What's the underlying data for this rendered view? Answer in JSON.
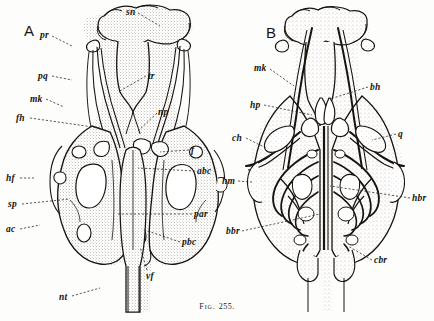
{
  "figure": {
    "caption_prefix": "Fig.",
    "caption_number": "255.",
    "panels": [
      {
        "id": "A",
        "letter": "A"
      },
      {
        "id": "B",
        "letter": "B"
      }
    ]
  },
  "colors": {
    "ink": "#17140f",
    "stipple": "#6e6456",
    "paper": "#fdfdfb",
    "leader": "#2a251e"
  },
  "labels_panel_a": [
    {
      "key": "sn",
      "text": "sn",
      "x": 126,
      "y": 8,
      "leader": [
        [
          138,
          13
        ],
        [
          160,
          26
        ]
      ]
    },
    {
      "key": "pr",
      "text": "pr",
      "x": 40,
      "y": 31,
      "leader": [
        [
          52,
          36
        ],
        [
          72,
          46
        ]
      ]
    },
    {
      "key": "pq",
      "text": "pq",
      "x": 38,
      "y": 72,
      "leader": [
        [
          52,
          76
        ],
        [
          72,
          80
        ]
      ]
    },
    {
      "key": "mk",
      "text": "mk",
      "x": 30,
      "y": 95,
      "leader": [
        [
          46,
          99
        ],
        [
          64,
          107
        ]
      ]
    },
    {
      "key": "fh",
      "text": "fh",
      "x": 16,
      "y": 114,
      "leader": [
        [
          30,
          118
        ],
        [
          100,
          128
        ]
      ]
    },
    {
      "key": "tr",
      "text": "tr",
      "x": 148,
      "y": 72,
      "leader": [
        [
          146,
          76
        ],
        [
          118,
          92
        ]
      ]
    },
    {
      "key": "np",
      "text": "np",
      "x": 158,
      "y": 108,
      "leader": [
        [
          157,
          113
        ],
        [
          137,
          132
        ]
      ]
    },
    {
      "key": "f",
      "text": "f",
      "x": 191,
      "y": 146,
      "leader": [
        [
          189,
          150
        ],
        [
          160,
          152
        ]
      ]
    },
    {
      "key": "abc",
      "text": "abc",
      "x": 197,
      "y": 167,
      "leader": [
        [
          195,
          171
        ],
        [
          138,
          168
        ]
      ]
    },
    {
      "key": "hf",
      "text": "hf",
      "x": 6,
      "y": 174,
      "leader": [
        [
          20,
          178
        ],
        [
          34,
          178
        ]
      ]
    },
    {
      "key": "sp",
      "text": "sp",
      "x": 8,
      "y": 200,
      "leader": [
        [
          22,
          204
        ],
        [
          70,
          199
        ]
      ]
    },
    {
      "key": "par",
      "text": "par",
      "x": 194,
      "y": 210,
      "leader": [
        [
          192,
          214
        ],
        [
          118,
          214
        ]
      ]
    },
    {
      "key": "ac",
      "text": "ac",
      "x": 6,
      "y": 225,
      "leader": [
        [
          20,
          229
        ],
        [
          40,
          225
        ]
      ]
    },
    {
      "key": "pbc",
      "text": "pbc",
      "x": 182,
      "y": 238,
      "leader": [
        [
          180,
          242
        ],
        [
          142,
          229
        ]
      ]
    },
    {
      "key": "vf",
      "text": "vf",
      "x": 146,
      "y": 272,
      "leader": [
        [
          147,
          270
        ],
        [
          140,
          247
        ]
      ]
    },
    {
      "key": "nt",
      "text": "nt",
      "x": 59,
      "y": 293,
      "leader": [
        [
          72,
          296
        ],
        [
          100,
          288
        ]
      ]
    }
  ],
  "labels_panel_b": [
    {
      "key": "mk",
      "text": "mk",
      "x": 254,
      "y": 64,
      "leader": [
        [
          270,
          69
        ],
        [
          294,
          86
        ]
      ]
    },
    {
      "key": "hp",
      "text": "hp",
      "x": 250,
      "y": 101,
      "leader": [
        [
          264,
          105
        ],
        [
          312,
          115
        ]
      ]
    },
    {
      "key": "bh",
      "text": "bh",
      "x": 370,
      "y": 83,
      "leader": [
        [
          368,
          87
        ],
        [
          330,
          99
        ]
      ]
    },
    {
      "key": "ch",
      "text": "ch",
      "x": 232,
      "y": 134,
      "leader": [
        [
          246,
          138
        ],
        [
          266,
          148
        ]
      ]
    },
    {
      "key": "q",
      "text": "q",
      "x": 398,
      "y": 130,
      "leader": [
        [
          396,
          134
        ],
        [
          372,
          140
        ]
      ]
    },
    {
      "key": "hm",
      "text": "hm",
      "x": 222,
      "y": 177,
      "leader": [
        [
          238,
          181
        ],
        [
          252,
          182
        ]
      ]
    },
    {
      "key": "hbr",
      "text": "hbr",
      "x": 412,
      "y": 194,
      "leader": [
        [
          410,
          198
        ],
        [
          330,
          186
        ]
      ]
    },
    {
      "key": "bbr",
      "text": "bbr",
      "x": 226,
      "y": 227,
      "leader": [
        [
          242,
          231
        ],
        [
          320,
          214
        ]
      ]
    },
    {
      "key": "cbr",
      "text": "cbr",
      "x": 374,
      "y": 256,
      "leader": [
        [
          372,
          260
        ],
        [
          348,
          246
        ]
      ]
    }
  ]
}
